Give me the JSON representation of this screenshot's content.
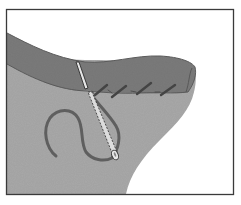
{
  "illustration": {
    "subject": "hand sewing a seam with needle and thread",
    "colors": {
      "background": "#ffffff",
      "frame": "#3a3a3a",
      "fabric_body": "#a9a9a9",
      "fabric_flap": "#7b7b7b",
      "flap_outline": "#555555",
      "thread": "#5f5f5f",
      "stitch": "#4a4a4a",
      "needle_fill": "#e6e6e6",
      "needle_outline": "#2e2e2e"
    },
    "stitch_count": 4
  }
}
